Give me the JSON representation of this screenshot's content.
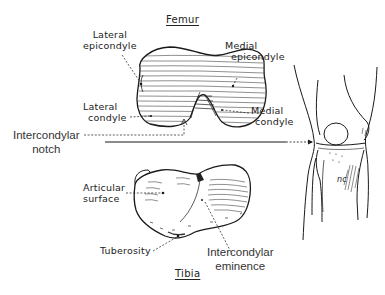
{
  "figure": {
    "femur": {
      "title": "Femur",
      "labels": {
        "lateral_epicondyle": [
          "Lateral",
          "epicondyle"
        ],
        "medial_epicondyle": [
          "Medial",
          "epicondyle"
        ],
        "lateral_condyle": [
          "Lateral",
          "condyle"
        ],
        "medial_condyle": [
          "Medial",
          "condyle"
        ],
        "intercondylar_notch": [
          "Intercondylar",
          "notch"
        ]
      }
    },
    "tibia": {
      "title": "Tibia",
      "labels": {
        "articular_surface": [
          "Articular",
          "surface"
        ],
        "tuberosity": "Tuberosity",
        "intercondylar_eminence": [
          "Intercondylar",
          "eminence"
        ]
      }
    },
    "knee_view": {
      "signature": "nc"
    },
    "colors": {
      "ink": "#1a1a1a",
      "background": "#ffffff"
    }
  }
}
